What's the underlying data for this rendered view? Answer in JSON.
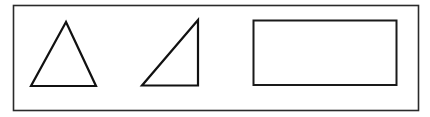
{
  "canvas": {
    "width": 430,
    "height": 117,
    "background": "#ffffff"
  },
  "frame": {
    "x": 13.5,
    "y": 5.5,
    "width": 405,
    "height": 105,
    "stroke": "#2a2a2a",
    "stroke_width": 1.6
  },
  "shapes": [
    {
      "id": "triangle-isosceles",
      "type": "triangle",
      "kind": "isosceles",
      "points": "66,22 31,86 96,86",
      "stroke": "#111111",
      "stroke_width": 2.2
    },
    {
      "id": "triangle-right",
      "type": "triangle",
      "kind": "right",
      "points": "198,20 142,85.5 198,85.5",
      "stroke": "#111111",
      "stroke_width": 2.2
    },
    {
      "id": "rectangle",
      "type": "rectangle",
      "x": 253.5,
      "y": 20.5,
      "width": 143,
      "height": 64.5,
      "stroke": "#1a1a1a",
      "stroke_width": 2.0
    }
  ]
}
